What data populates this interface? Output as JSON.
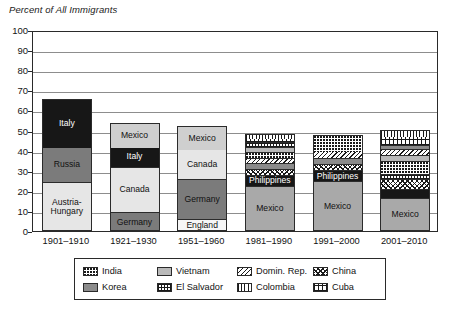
{
  "chart_data": {
    "type": "bar",
    "title": "",
    "ylabel": "Percent of All Immigrants",
    "xlabel": "",
    "ylim": [
      0,
      100
    ],
    "yticks": [
      0,
      10,
      20,
      30,
      40,
      50,
      60,
      70,
      80,
      90,
      100
    ],
    "grid": true,
    "stacked": true,
    "legend_position": "bottom",
    "categories": [
      "1901–1910",
      "1921–1930",
      "1951–1960",
      "1981–1990",
      "1991–2000",
      "2001–2010"
    ],
    "bars": [
      {
        "category": "1901–1910",
        "total": 65.5,
        "segments": [
          {
            "label": "Austria-Hungary",
            "value": 24.4,
            "fill": "f-vlitegray",
            "label_color": "dark"
          },
          {
            "label": "Russia",
            "value": 17.6,
            "fill": "f-darkgray",
            "label_color": "dark"
          },
          {
            "label": "Italy",
            "value": 23.5,
            "fill": "f-black",
            "label_color": "light"
          }
        ]
      },
      {
        "category": "1921–1930",
        "total": 53.8,
        "segments": [
          {
            "label": "Germany",
            "value": 9.2,
            "fill": "f-darkgray",
            "label_color": "dark"
          },
          {
            "label": "Canada",
            "value": 22.8,
            "fill": "f-vlitegray",
            "label_color": "dark"
          },
          {
            "label": "Italy",
            "value": 10.0,
            "fill": "f-black",
            "label_color": "light"
          },
          {
            "label": "Mexico",
            "value": 11.8,
            "fill": "f-litegray",
            "label_color": "dark"
          }
        ]
      },
      {
        "category": "1951–1960",
        "total": 52.2,
        "segments": [
          {
            "label": "England",
            "value": 5.8,
            "fill": "f-white",
            "label_color": "dark"
          },
          {
            "label": "Germany",
            "value": 20.0,
            "fill": "f-darkgray",
            "label_color": "dark"
          },
          {
            "label": "Canada",
            "value": 15.0,
            "fill": "f-vlitegray",
            "label_color": "dark"
          },
          {
            "label": "Mexico",
            "value": 11.4,
            "fill": "f-litegray",
            "label_color": "dark"
          }
        ]
      },
      {
        "category": "1981–1990",
        "total": 48.3,
        "segments": [
          {
            "label": "Mexico",
            "value": 22.6,
            "fill": "f-midgray",
            "label_color": "dark"
          },
          {
            "label": "Philippines",
            "value": 5.0,
            "fill": "f-black",
            "label_color": "light"
          },
          {
            "label": "China",
            "value": 3.1,
            "fill": "p-china",
            "label_color": "none"
          },
          {
            "label": "Korea",
            "value": 3.0,
            "fill": "p-korea",
            "label_color": "none"
          },
          {
            "label": "Domin. Rep.",
            "value": 2.6,
            "fill": "p-domin",
            "label_color": "none"
          },
          {
            "label": "India",
            "value": 2.9,
            "fill": "p-india",
            "label_color": "none"
          },
          {
            "label": "Vietnam",
            "value": 2.8,
            "fill": "p-vietnam",
            "label_color": "none"
          },
          {
            "label": "El Salvador",
            "value": 2.2,
            "fill": "p-elsalvador",
            "label_color": "none"
          },
          {
            "label": "Cuba",
            "value": 2.1,
            "fill": "p-cuba",
            "label_color": "none"
          },
          {
            "label": "Colombia",
            "value": 2.0,
            "fill": "p-colombia",
            "label_color": "none"
          }
        ]
      },
      {
        "category": "1991–2000",
        "total": 47.8,
        "segments": [
          {
            "label": "Mexico",
            "value": 24.7,
            "fill": "f-midgray",
            "label_color": "dark"
          },
          {
            "label": "Philippines",
            "value": 5.5,
            "fill": "f-black",
            "label_color": "light"
          },
          {
            "label": "China",
            "value": 3.0,
            "fill": "p-china",
            "label_color": "none"
          },
          {
            "label": "Korea",
            "value": 3.3,
            "fill": "p-korea",
            "label_color": "none"
          },
          {
            "label": "Domin. Rep.",
            "value": 3.2,
            "fill": "p-domin",
            "label_color": "none"
          },
          {
            "label": "India",
            "value": 8.1,
            "fill": "p-india",
            "label_color": "none"
          }
        ]
      },
      {
        "category": "2001–2010",
        "total": 50.3,
        "segments": [
          {
            "label": "Mexico",
            "value": 16.3,
            "fill": "f-midgray",
            "label_color": "dark"
          },
          {
            "label": "Philippines",
            "value": 4.4,
            "fill": "f-black",
            "label_color": "light"
          },
          {
            "label": "China",
            "value": 5.3,
            "fill": "p-china",
            "label_color": "none"
          },
          {
            "label": "El Salvador",
            "value": 2.3,
            "fill": "p-elsalvador",
            "label_color": "none"
          },
          {
            "label": "India",
            "value": 6.5,
            "fill": "p-india",
            "label_color": "none"
          },
          {
            "label": "Vietnam",
            "value": 2.9,
            "fill": "p-vietnam",
            "label_color": "none"
          },
          {
            "label": "Domin. Rep.",
            "value": 3.1,
            "fill": "p-domin",
            "label_color": "none"
          },
          {
            "label": "Korea",
            "value": 2.1,
            "fill": "p-korea",
            "label_color": "none"
          },
          {
            "label": "Cuba",
            "value": 4.2,
            "fill": "p-cuba",
            "label_color": "none"
          },
          {
            "label": "Colombia",
            "value": 3.2,
            "fill": "p-colombia",
            "label_color": "none"
          }
        ]
      }
    ],
    "legend": [
      {
        "label": "India",
        "fill": "p-india"
      },
      {
        "label": "Korea",
        "fill": "p-korea"
      },
      {
        "label": "Vietnam",
        "fill": "p-vietnam"
      },
      {
        "label": "El Salvador",
        "fill": "p-elsalvador"
      },
      {
        "label": "Domin. Rep.",
        "fill": "p-domin"
      },
      {
        "label": "Colombia",
        "fill": "p-colombia"
      },
      {
        "label": "China",
        "fill": "p-china"
      },
      {
        "label": "Cuba",
        "fill": "p-cuba"
      }
    ]
  }
}
